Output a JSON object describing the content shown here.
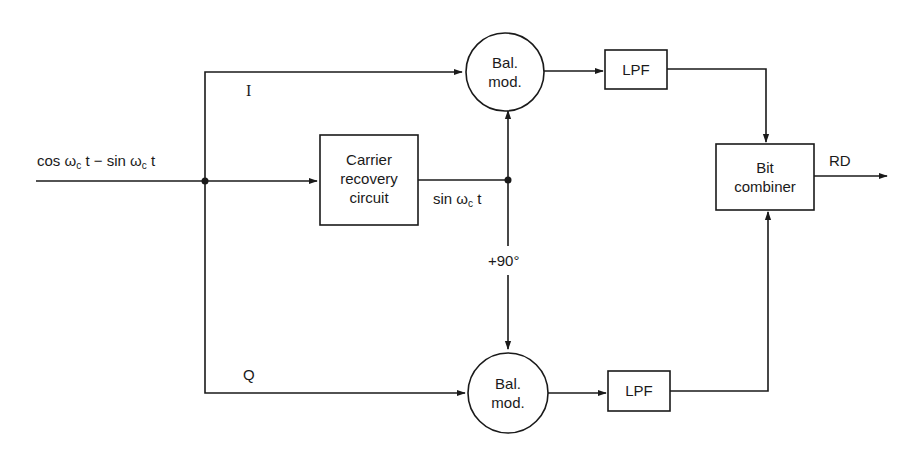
{
  "diagram": {
    "input": {
      "label_cos": "cos ω",
      "label_c1": "c",
      "label_mid": " t − sin ω",
      "label_c2": "c",
      "label_t": " t"
    },
    "branches": {
      "i_label": "I",
      "q_label": "Q"
    },
    "blocks": {
      "carrier_recovery": {
        "line1": "Carrier",
        "line2": "recovery",
        "line3": "circuit"
      },
      "bal_mod_top": {
        "line1": "Bal.",
        "line2": "mod."
      },
      "bal_mod_bottom": {
        "line1": "Bal.",
        "line2": "mod."
      },
      "lpf_top": {
        "label": "LPF"
      },
      "lpf_bottom": {
        "label": "LPF"
      },
      "bit_combiner": {
        "line1": "Bit",
        "line2": "combiner"
      }
    },
    "carrier_signal": {
      "label_sin": "sin ω",
      "label_c": "c",
      "label_t": " t"
    },
    "phase_shift": {
      "label": "+90°"
    },
    "output": {
      "label": "RD"
    },
    "colors": {
      "line": "#1a1a1a",
      "background": "#ffffff"
    }
  }
}
